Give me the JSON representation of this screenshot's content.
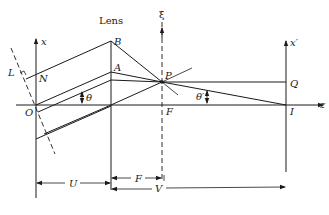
{
  "diagram": {
    "type": "optics-lens-ray-diagram",
    "labels": {
      "lens": "Lens",
      "xi": "ξ",
      "x_axis": "x",
      "x_prime_axis": "x′",
      "z_axis": "z",
      "B": "B",
      "A": "A",
      "P": "P",
      "Q": "Q",
      "N": "N",
      "L": "L",
      "O": "O",
      "F_point": "F",
      "I": "I",
      "theta": "θ",
      "theta_prime": "θ′",
      "U": "U",
      "F_distance": "F",
      "V": "V"
    },
    "points": {
      "O": [
        36,
        105
      ],
      "N": [
        36,
        75
      ],
      "A": [
        111,
        72
      ],
      "B": [
        111,
        41
      ],
      "P": [
        162,
        82
      ],
      "F": [
        162,
        105
      ],
      "Q": [
        286,
        82
      ],
      "I": [
        286,
        105
      ]
    },
    "colors": {
      "line": "#1a1a1a",
      "background": "#ffffff"
    }
  }
}
